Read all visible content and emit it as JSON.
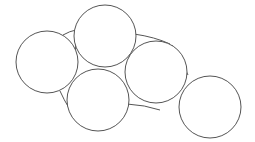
{
  "diagram": {
    "width": 255,
    "height": 142,
    "stroke_color": "#555555",
    "fill_color": "#ffffff",
    "background": "#ffffff",
    "circles": [
      {
        "id": "circle-1",
        "cx": 47,
        "cy": 62,
        "r": 31
      },
      {
        "id": "circle-2",
        "cx": 105,
        "cy": 36,
        "r": 31
      },
      {
        "id": "circle-3",
        "cx": 98,
        "cy": 100,
        "r": 31
      },
      {
        "id": "circle-4",
        "cx": 156,
        "cy": 72,
        "r": 31
      },
      {
        "id": "circle-5",
        "cx": 210,
        "cy": 107,
        "r": 31
      }
    ],
    "connectors": [
      {
        "id": "arc-1-2",
        "d": "M 63 35 Q 70 31 76 30"
      },
      {
        "id": "arc-1-3",
        "d": "M 60 91 Q 64 100 69 108"
      },
      {
        "id": "arc-2-4",
        "d": "M 134 34 Q 155 37 170 44"
      },
      {
        "id": "arc-4-5",
        "d": "M 172 45 Q 181 59 188 75"
      },
      {
        "id": "arc-3-4",
        "d": "M 127 104 Q 145 105 160 110"
      },
      {
        "id": "arc-2-3-left",
        "d": "M 76 42 Q 75 57 74 72"
      },
      {
        "id": "arc-2-3-right",
        "d": "M 130 54 Q 128 62 127 70"
      }
    ]
  }
}
